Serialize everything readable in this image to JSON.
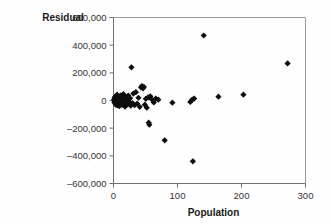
{
  "chart_data": {
    "type": "scatter",
    "title": "",
    "xlabel": "Population",
    "ylabel": "Residual",
    "xlim": [
      0,
      300
    ],
    "ylim": [
      -600000,
      600000
    ],
    "xticks": [
      0,
      100,
      200,
      300
    ],
    "xticklabels": [
      "0",
      "100",
      "200",
      "300"
    ],
    "yticks": [
      -600000,
      -400000,
      -200000,
      0,
      200000,
      400000,
      600000
    ],
    "yticklabels": [
      "–600,000",
      "–400,000",
      "–200,000",
      "0",
      "200,000",
      "400,000",
      "600,000"
    ],
    "grid": false,
    "legend": false,
    "marker": "diamond",
    "marker_color": "#0d0d0d",
    "points": [
      [
        0.8,
        5000
      ],
      [
        1.2,
        -12000
      ],
      [
        1.6,
        18000
      ],
      [
        2.0,
        -4000
      ],
      [
        2.4,
        26000
      ],
      [
        2.8,
        -22000
      ],
      [
        3.2,
        8000
      ],
      [
        3.6,
        -30000
      ],
      [
        4.0,
        34000
      ],
      [
        4.4,
        -8000
      ],
      [
        4.8,
        15000
      ],
      [
        5.2,
        -18000
      ],
      [
        5.6,
        42000
      ],
      [
        6.0,
        -36000
      ],
      [
        6.4,
        2000
      ],
      [
        6.8,
        22000
      ],
      [
        7.2,
        -26000
      ],
      [
        7.6,
        12000
      ],
      [
        8.0,
        -14000
      ],
      [
        8.6,
        30000
      ],
      [
        9.2,
        -40000
      ],
      [
        9.8,
        6000
      ],
      [
        10.4,
        20000
      ],
      [
        11.0,
        -20000
      ],
      [
        11.6,
        38000
      ],
      [
        12.2,
        -10000
      ],
      [
        12.8,
        14000
      ],
      [
        13.4,
        -32000
      ],
      [
        14.0,
        24000
      ],
      [
        14.8,
        -6000
      ],
      [
        15.6,
        46000
      ],
      [
        16.4,
        -24000
      ],
      [
        17.2,
        10000
      ],
      [
        18.0,
        -44000
      ],
      [
        19.0,
        28000
      ],
      [
        20.0,
        -16000
      ],
      [
        21.0,
        4000
      ],
      [
        22.0,
        -28000
      ],
      [
        23.0,
        36000
      ],
      [
        24.5,
        -12000
      ],
      [
        26.0,
        16000
      ],
      [
        27.0,
        -38000
      ],
      [
        28.0,
        240000
      ],
      [
        29.5,
        -18000
      ],
      [
        31.0,
        50000
      ],
      [
        33.0,
        -34000
      ],
      [
        35.0,
        60000
      ],
      [
        37.0,
        -22000
      ],
      [
        39.0,
        20000
      ],
      [
        41.0,
        -46000
      ],
      [
        43.0,
        95000
      ],
      [
        44.5,
        105000
      ],
      [
        46.0,
        88000
      ],
      [
        47.5,
        98000
      ],
      [
        49.0,
        -30000
      ],
      [
        50.5,
        12000
      ],
      [
        52.0,
        -52000
      ],
      [
        54.0,
        22000
      ],
      [
        55.0,
        -160000
      ],
      [
        56.0,
        -175000
      ],
      [
        57.5,
        30000
      ],
      [
        60.0,
        8000
      ],
      [
        63.0,
        -14000
      ],
      [
        66.0,
        14000
      ],
      [
        70.0,
        6000
      ],
      [
        80.0,
        -288000
      ],
      [
        92.0,
        -16000
      ],
      [
        120.0,
        -10000
      ],
      [
        123.0,
        6000
      ],
      [
        124.0,
        -440000
      ],
      [
        126.0,
        14000
      ],
      [
        141.0,
        470000
      ],
      [
        164.0,
        28000
      ],
      [
        203.0,
        42000
      ],
      [
        272.0,
        268000
      ]
    ]
  }
}
